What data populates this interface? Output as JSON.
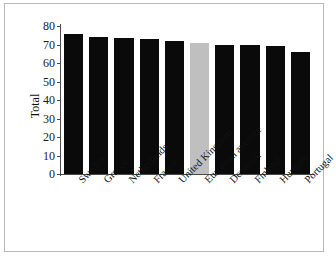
{
  "chart_data": {
    "type": "bar",
    "title": "",
    "xlabel": "",
    "ylabel": "Total",
    "ylim": [
      0,
      80
    ],
    "yticks": [
      0,
      10,
      20,
      30,
      40,
      50,
      60,
      70,
      80
    ],
    "grid": false,
    "legend": "none",
    "categories": [
      "Sweden",
      "Greece",
      "Netherlands",
      "France",
      "United Kingdom",
      "European average",
      "Denmark",
      "Finland",
      "Hungary",
      "Portugal"
    ],
    "values": [
      75.5,
      74.0,
      73.5,
      73.0,
      72.0,
      71.0,
      70.0,
      69.5,
      69.0,
      66.0
    ],
    "bar_colors": [
      "#0a0a0a",
      "#0a0a0a",
      "#0a0a0a",
      "#0a0a0a",
      "#0a0a0a",
      "#bfbfbf",
      "#0a0a0a",
      "#0a0a0a",
      "#0a0a0a",
      "#0a0a0a"
    ],
    "highlighted_category": "European average"
  },
  "colors": {
    "bar_default": "#0a0a0a",
    "bar_highlight": "#bfbfbf",
    "axis": "#4a4a4a",
    "text": "#111111",
    "frame_border": "#b9b9b9",
    "background": "#ffffff"
  }
}
